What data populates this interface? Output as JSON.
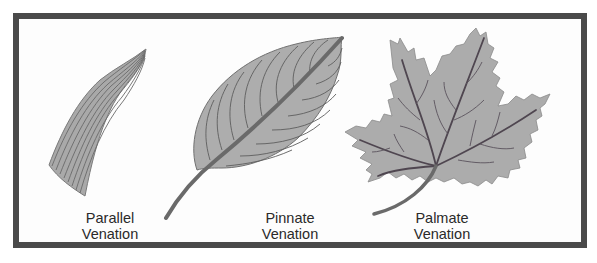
{
  "figure": {
    "colors": {
      "frame_border": "#4a4a4a",
      "background": "#fdfdfd",
      "leaf_fill": "#a9a9a9",
      "leaf_outline": "#6e6e6e",
      "vein": "#555555",
      "midrib_pinnate": "#6a6a6a",
      "midrib_palmate": "#4f4650"
    },
    "panels": [
      {
        "id": "parallel",
        "label_line1": "Parallel",
        "label_line2": "Venation"
      },
      {
        "id": "pinnate",
        "label_line1": "Pinnate",
        "label_line2": "Venation"
      },
      {
        "id": "palmate",
        "label_line1": "Palmate",
        "label_line2": "Venation"
      }
    ]
  }
}
